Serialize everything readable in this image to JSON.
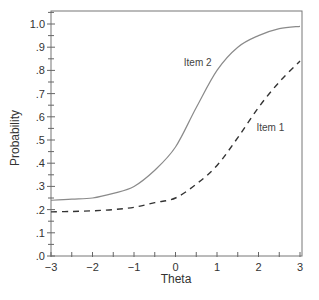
{
  "chart_data": {
    "type": "line",
    "title": "",
    "xlabel": "Theta",
    "ylabel": "Probability",
    "xlim": [
      -3,
      3
    ],
    "ylim": [
      0,
      1.05
    ],
    "grid": false,
    "legend_position": "inline labels",
    "x_ticks": [
      -3,
      -2,
      -1,
      0,
      1,
      2,
      3
    ],
    "x_tick_labels": [
      "−3",
      "−2",
      "−1",
      "0",
      "1",
      "2",
      "3"
    ],
    "y_ticks": [
      0,
      0.1,
      0.2,
      0.3,
      0.4,
      0.5,
      0.6,
      0.7,
      0.8,
      0.9,
      1.0
    ],
    "y_tick_labels": [
      ".0",
      ".1",
      ".2",
      ".3",
      ".4",
      ".5",
      ".6",
      ".7",
      ".8",
      ".9",
      "1.0"
    ],
    "x": [
      -3,
      -2.5,
      -2,
      -1.5,
      -1,
      -0.5,
      0,
      0.5,
      1,
      1.5,
      2,
      2.5,
      3
    ],
    "series": [
      {
        "name": "Item 1",
        "style": "dashed",
        "color": "#333333",
        "values": [
          0.19,
          0.192,
          0.195,
          0.2,
          0.21,
          0.23,
          0.25,
          0.31,
          0.39,
          0.51,
          0.64,
          0.75,
          0.84
        ]
      },
      {
        "name": "Item 2",
        "style": "solid",
        "color": "#8a8a8a",
        "values": [
          0.24,
          0.245,
          0.25,
          0.27,
          0.3,
          0.37,
          0.47,
          0.64,
          0.8,
          0.9,
          0.95,
          0.98,
          0.99
        ]
      }
    ],
    "annotations": [
      {
        "text": "Item 2",
        "x": 0.2,
        "y": 0.82
      },
      {
        "text": "Item 1",
        "x": 1.95,
        "y": 0.54
      }
    ]
  }
}
